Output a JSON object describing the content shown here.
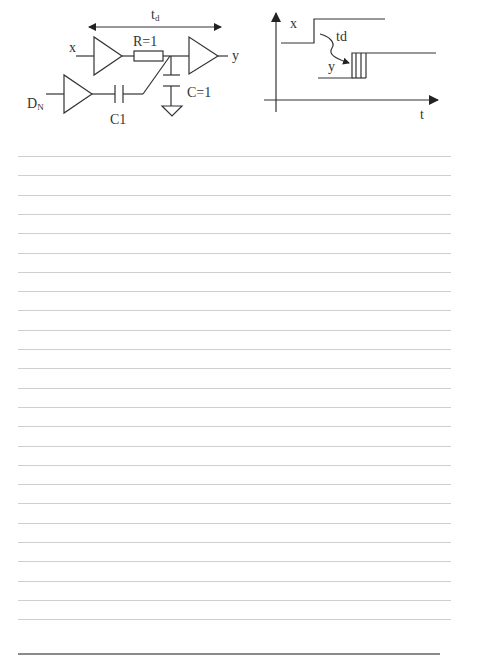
{
  "circuit": {
    "delay_label": "t",
    "delay_label_sub": "d",
    "input_x_label": "x",
    "output_y_label": "y",
    "resistor_label": "R=1",
    "capacitor_label": "C=1",
    "noise_input_label": "D",
    "noise_input_sub": "N",
    "coupling_cap_label": "C1",
    "components": [
      "buffer-x",
      "resistor-R",
      "buffer-y",
      "capacitor-C-to-ground",
      "buffer-DN",
      "coupling-capacitor-C1"
    ]
  },
  "timing": {
    "x_signal_label": "x",
    "y_signal_label": "y",
    "delay_label": "td",
    "time_axis_label": "t"
  },
  "page": {
    "ruled_line_count": 25,
    "ruled_line_start_y": 156,
    "ruled_line_spacing": 19.3,
    "rule_color": "#cfcfcf",
    "bottom_rule_color": "#8a8a8a",
    "ink_color": "#333333"
  }
}
